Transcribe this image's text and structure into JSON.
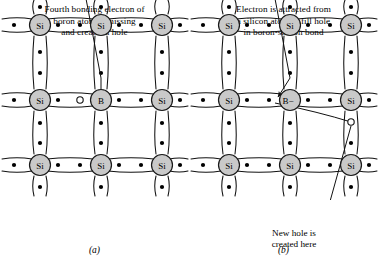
{
  "figure": {
    "type": "diagram",
    "background_color": "#ffffff",
    "atom_fill_color": "#c9c9c9",
    "atom_stroke_color": "#1a1a1a",
    "bond_color": "#1a1a1a",
    "electron_color": "#000000"
  },
  "panels": [
    {
      "id": "a",
      "label": "(a)",
      "caption_lines": [
        "Fourth bonding electron of",
        "boron atom is missing",
        "and creates a hole"
      ],
      "atoms": [
        {
          "symbol": "Si",
          "row": 0,
          "col": 0
        },
        {
          "symbol": "Si",
          "row": 0,
          "col": 1
        },
        {
          "symbol": "Si",
          "row": 0,
          "col": 2
        },
        {
          "symbol": "Si",
          "row": 1,
          "col": 0
        },
        {
          "symbol": "B",
          "row": 1,
          "col": 1
        },
        {
          "symbol": "Si",
          "row": 1,
          "col": 2
        },
        {
          "symbol": "Si",
          "row": 2,
          "col": 0
        },
        {
          "symbol": "Si",
          "row": 2,
          "col": 1
        },
        {
          "symbol": "Si",
          "row": 2,
          "col": 2
        }
      ],
      "hole": {
        "present": true,
        "description": "open circle left of boron atom"
      },
      "pointer": {
        "from": "caption",
        "to": "hole",
        "style": "line with arrowhead"
      }
    },
    {
      "id": "b",
      "label": "(b)",
      "caption_lines": [
        "Electron is attracted from",
        "a silicon atom to fill hole",
        "in boron-silicon bond"
      ],
      "atoms": [
        {
          "symbol": "Si",
          "row": 0,
          "col": 0
        },
        {
          "symbol": "Si",
          "row": 0,
          "col": 1
        },
        {
          "symbol": "Si",
          "row": 0,
          "col": 2
        },
        {
          "symbol": "Si",
          "row": 1,
          "col": 0
        },
        {
          "symbol": "B−",
          "row": 1,
          "col": 1
        },
        {
          "symbol": "Si",
          "row": 1,
          "col": 2
        },
        {
          "symbol": "Si",
          "row": 2,
          "col": 0
        },
        {
          "symbol": "Si",
          "row": 2,
          "col": 1
        },
        {
          "symbol": "Si",
          "row": 2,
          "col": 2
        }
      ],
      "hole": {
        "present": true,
        "description": "open circle above-left of bottom-right silicon atom"
      },
      "hole_caption_lines": [
        "New hole is",
        "created here"
      ],
      "pointer": {
        "from": "hole-caption",
        "to": "hole",
        "style": "line"
      },
      "electron_path": {
        "from": "filled boron-silicon bond",
        "to": "new hole",
        "style": "curved line"
      }
    }
  ]
}
